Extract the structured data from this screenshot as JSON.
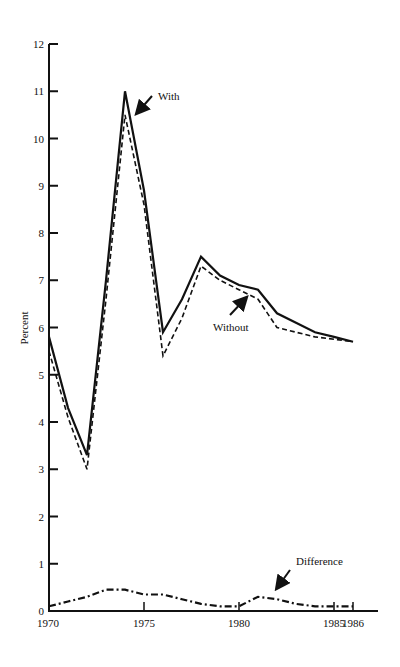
{
  "chart_data": {
    "type": "line",
    "title": "",
    "xlabel": "",
    "ylabel": "Percent",
    "ylim": [
      0,
      12
    ],
    "xlim": [
      1970,
      1986
    ],
    "grid": false,
    "legend": "none (inline annotations with arrows)",
    "y_ticks": [
      "0",
      "1",
      "2",
      "3",
      "4",
      "5",
      "6",
      "7",
      "8",
      "9",
      "10",
      "11",
      "12"
    ],
    "x_tick_labels": [
      "1970",
      "1975",
      "1980",
      "1985",
      "1986"
    ],
    "x_tick_years": [
      1970,
      1975,
      1980,
      1985,
      1986
    ],
    "x": [
      1970,
      1971,
      1972,
      1973,
      1974,
      1975,
      1976,
      1977,
      1978,
      1979,
      1980,
      1981,
      1982,
      1983,
      1984,
      1985,
      1986
    ],
    "series": [
      {
        "name": "With",
        "style": "solid",
        "values": [
          5.8,
          4.3,
          3.3,
          7.0,
          11.0,
          8.9,
          5.9,
          6.6,
          7.5,
          7.1,
          6.9,
          6.8,
          6.3,
          6.1,
          5.9,
          5.8,
          5.7
        ]
      },
      {
        "name": "Without",
        "style": "dashed",
        "values": [
          5.5,
          4.1,
          3.0,
          6.6,
          10.5,
          8.6,
          5.4,
          6.2,
          7.3,
          7.0,
          6.8,
          6.6,
          6.0,
          5.9,
          5.8,
          5.75,
          5.7
        ]
      },
      {
        "name": "Difference",
        "style": "dash-dot",
        "values": [
          0.1,
          0.2,
          0.3,
          0.45,
          0.45,
          0.35,
          0.35,
          0.25,
          0.15,
          0.1,
          0.1,
          0.3,
          0.25,
          0.15,
          0.1,
          0.1,
          0.1
        ]
      }
    ],
    "annotations": [
      {
        "text": "With",
        "points_to_series": "With",
        "near_year": 1974.3
      },
      {
        "text": "Without",
        "points_to_series": "Without",
        "near_year": 1980.5
      },
      {
        "text": "Difference",
        "points_to_series": "Difference",
        "near_year": 1981.7
      }
    ]
  },
  "colors": {
    "ink": "#111111",
    "background": "#ffffff"
  }
}
